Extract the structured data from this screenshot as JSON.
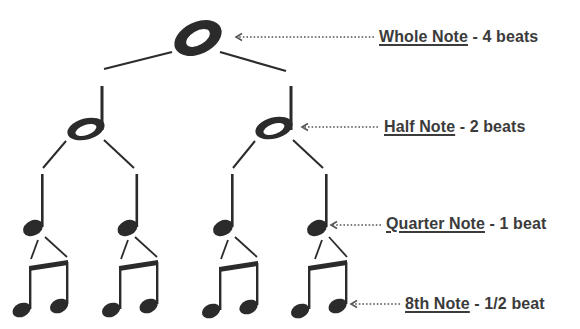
{
  "colors": {
    "ink": "#2b2b2b",
    "text": "#3b3b3b",
    "arrow": "#555555",
    "background": "#ffffff"
  },
  "labels": [
    {
      "term": "Whole Note",
      "suffix": " - 4 beats",
      "x": 379,
      "y": 28
    },
    {
      "term": "Half Note",
      "suffix": " - 2 beats",
      "x": 384,
      "y": 117
    },
    {
      "term": "Quarter Note",
      "suffix": " - 1 beat",
      "x": 386,
      "y": 214
    },
    {
      "term": "8th Note",
      "suffix": " - 1/2 beat",
      "x": 405,
      "y": 294
    }
  ],
  "tree": {
    "whole_note": {
      "cx": 198,
      "cy": 38,
      "beats": 4
    },
    "half_notes": [
      {
        "cx": 86,
        "cy": 129,
        "beats": 2
      },
      {
        "cx": 274,
        "cy": 128,
        "beats": 2
      }
    ],
    "quarter_notes": [
      {
        "cx": 34,
        "cy": 227,
        "beats": 1
      },
      {
        "cx": 128,
        "cy": 227,
        "beats": 1
      },
      {
        "cx": 224,
        "cy": 227,
        "beats": 1
      },
      {
        "cx": 318,
        "cy": 227,
        "beats": 1
      }
    ],
    "eighth_pairs": [
      {
        "left_x": 30,
        "right_x": 67,
        "beats": 0.5
      },
      {
        "left_x": 120,
        "right_x": 157,
        "beats": 0.5
      },
      {
        "left_x": 220,
        "right_x": 257,
        "beats": 0.5
      },
      {
        "left_x": 309,
        "right_x": 346,
        "beats": 0.5
      }
    ]
  },
  "arrows": [
    {
      "target": "whole-note",
      "x1": 374,
      "x2": 236,
      "y": 37
    },
    {
      "target": "half-note",
      "x1": 378,
      "x2": 302,
      "y": 127
    },
    {
      "target": "quarter-note",
      "x1": 381,
      "x2": 331,
      "y": 225
    },
    {
      "target": "eighth-note",
      "x1": 400,
      "x2": 351,
      "y": 304
    }
  ]
}
